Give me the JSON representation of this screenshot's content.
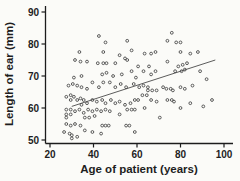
{
  "chart_data": {
    "type": "scatter",
    "title": "",
    "xlabel": "Age of patient (years)",
    "ylabel": "Length of ear (mm)",
    "xlim": [
      20,
      100
    ],
    "ylim": [
      50,
      90
    ],
    "xticks": [
      20,
      40,
      60,
      80,
      100
    ],
    "yticks": [
      50,
      60,
      70,
      80,
      90
    ],
    "grid": false,
    "legend": null,
    "marker": "open-circle",
    "marker_color": "#4a4a4a",
    "axis_color": "#1c1c1c",
    "background": "#fbfbf8",
    "trend_line": {
      "type": "linear",
      "x": [
        30,
        96
      ],
      "y": [
        60.5,
        75.0
      ],
      "color": "#4a4a4a"
    },
    "points": [
      [
        42.5,
        82.5
      ],
      [
        76,
        83.5
      ],
      [
        78,
        80.5
      ],
      [
        80,
        80.5
      ],
      [
        74,
        81
      ],
      [
        55.5,
        81
      ],
      [
        45.5,
        80.5
      ],
      [
        33.5,
        77.5
      ],
      [
        44.5,
        77.5
      ],
      [
        52,
        76.5
      ],
      [
        57.5,
        78
      ],
      [
        63.5,
        77
      ],
      [
        66.5,
        77
      ],
      [
        68.5,
        77.5
      ],
      [
        80,
        77.5
      ],
      [
        84.5,
        77
      ],
      [
        88,
        77.5
      ],
      [
        31.5,
        75
      ],
      [
        34,
        74.5
      ],
      [
        37,
        74.5
      ],
      [
        42,
        74
      ],
      [
        44.5,
        74
      ],
      [
        46,
        74
      ],
      [
        50,
        74
      ],
      [
        54.5,
        75.5
      ],
      [
        55.5,
        75
      ],
      [
        60.5,
        73
      ],
      [
        65.5,
        73
      ],
      [
        74,
        74.5
      ],
      [
        79,
        73
      ],
      [
        81,
        73.5
      ],
      [
        83,
        74
      ],
      [
        46,
        71
      ],
      [
        49,
        70
      ],
      [
        53,
        70.5
      ],
      [
        57.5,
        71.5
      ],
      [
        59.5,
        69.5
      ],
      [
        63,
        71.5
      ],
      [
        66.5,
        70.5
      ],
      [
        68.5,
        71.5
      ],
      [
        77.5,
        71.5
      ],
      [
        80.5,
        71.5
      ],
      [
        82,
        72
      ],
      [
        89,
        71.5
      ],
      [
        92,
        69
      ],
      [
        34.5,
        70
      ],
      [
        31,
        69.5
      ],
      [
        44,
        70.5
      ],
      [
        28.5,
        67
      ],
      [
        30.5,
        67.5
      ],
      [
        32.5,
        67
      ],
      [
        34.5,
        66.5
      ],
      [
        37,
        66
      ],
      [
        39.5,
        68
      ],
      [
        42.5,
        66.5
      ],
      [
        44.5,
        68
      ],
      [
        47.5,
        68
      ],
      [
        50,
        66.5
      ],
      [
        52.5,
        67.5
      ],
      [
        55,
        66.5
      ],
      [
        58.5,
        67.5
      ],
      [
        61,
        66.5
      ],
      [
        63,
        67
      ],
      [
        65,
        66.5
      ],
      [
        65,
        65.5
      ],
      [
        67,
        65.5
      ],
      [
        69,
        65.5
      ],
      [
        72,
        66.5
      ],
      [
        73.5,
        66
      ],
      [
        75.5,
        66
      ],
      [
        76.5,
        65.5
      ],
      [
        80,
        66.5
      ],
      [
        82,
        66
      ],
      [
        85.5,
        67
      ],
      [
        27.5,
        63.5
      ],
      [
        29.5,
        64
      ],
      [
        29.5,
        62.5
      ],
      [
        31,
        63.5
      ],
      [
        32.5,
        62.5
      ],
      [
        34,
        63
      ],
      [
        35.5,
        62.5
      ],
      [
        34.5,
        61
      ],
      [
        37,
        61.5
      ],
      [
        39.5,
        62.5
      ],
      [
        41.5,
        62
      ],
      [
        44,
        62.5
      ],
      [
        45.5,
        61.5
      ],
      [
        48,
        62.5
      ],
      [
        50,
        61.5
      ],
      [
        52,
        62
      ],
      [
        54.5,
        61
      ],
      [
        57,
        61.5
      ],
      [
        59,
        62.5
      ],
      [
        60.5,
        62.5
      ],
      [
        62.5,
        64
      ],
      [
        64.5,
        64
      ],
      [
        66.5,
        62.5
      ],
      [
        69,
        62
      ],
      [
        74,
        62.5
      ],
      [
        76,
        62.5
      ],
      [
        77,
        62
      ],
      [
        84.5,
        61.5
      ],
      [
        94.5,
        62.5
      ],
      [
        90.5,
        60.5
      ],
      [
        27.5,
        59.5
      ],
      [
        27.5,
        58
      ],
      [
        27.5,
        57
      ],
      [
        29.5,
        59.5
      ],
      [
        29.5,
        58
      ],
      [
        31.5,
        59
      ],
      [
        33.5,
        59.5
      ],
      [
        35.5,
        58.5
      ],
      [
        37.5,
        59.5
      ],
      [
        39.5,
        59
      ],
      [
        41.5,
        59.5
      ],
      [
        43.5,
        59
      ],
      [
        45.5,
        59.5
      ],
      [
        47.5,
        59
      ],
      [
        55.5,
        59.5
      ],
      [
        57.5,
        59.5
      ],
      [
        59,
        59.5
      ],
      [
        63.5,
        60
      ],
      [
        80,
        60
      ],
      [
        36,
        57
      ],
      [
        38,
        57
      ],
      [
        40.5,
        57.5
      ],
      [
        52,
        58
      ],
      [
        70.5,
        57
      ],
      [
        27.5,
        55
      ],
      [
        29.5,
        54.5
      ],
      [
        31.5,
        55
      ],
      [
        34,
        54.5
      ],
      [
        44,
        54.5
      ],
      [
        45.5,
        54.5
      ],
      [
        47,
        54.5
      ],
      [
        55,
        54.5
      ],
      [
        56.5,
        54.5
      ],
      [
        36,
        53
      ],
      [
        39.5,
        52.5
      ],
      [
        29,
        52
      ],
      [
        43.5,
        52
      ],
      [
        59,
        52.5
      ],
      [
        32.5,
        51
      ],
      [
        26.5,
        52.5
      ],
      [
        30,
        51.5
      ],
      [
        30,
        50.5
      ]
    ]
  }
}
